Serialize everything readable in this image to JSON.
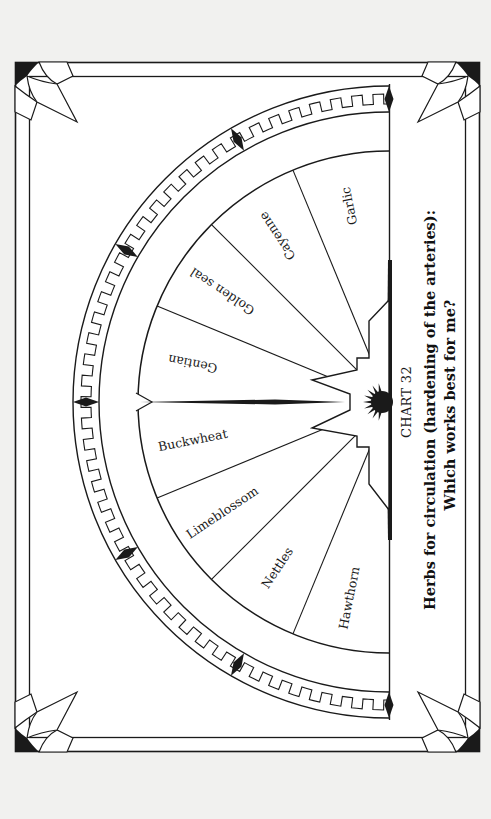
{
  "chart": {
    "number_label": "CHART 32",
    "title_line1": "Herbs for circulation (hardening of the arteries):",
    "title_line2": "Which works best for me?"
  },
  "fan": {
    "segments": [
      {
        "label": "Garlic"
      },
      {
        "label": "Cayenne"
      },
      {
        "label": "Golden seal"
      },
      {
        "label": "Gentian"
      },
      {
        "label": "Buckwheat"
      },
      {
        "label": "Limeblossom"
      },
      {
        "label": "Nettles"
      },
      {
        "label": "Hawthorn"
      }
    ]
  },
  "colors": {
    "page": "#f1f1ef",
    "paper": "#ffffff",
    "ink": "#1a1a1a"
  }
}
